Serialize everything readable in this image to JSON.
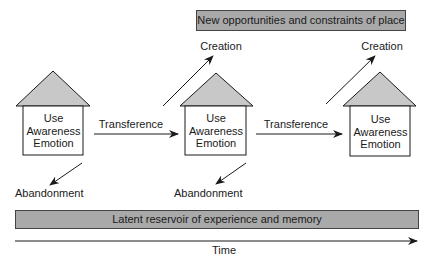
{
  "diagram": {
    "top_banner": "New opportunities and constraints of place",
    "bottom_banner": "Latent reservoir of experience and memory",
    "time_label": "Time",
    "houses": [
      {
        "lines": [
          "Use",
          "Awareness",
          "Emotion"
        ],
        "abandonment": "Abandonment",
        "creation": null
      },
      {
        "lines": [
          "Use",
          "Awareness",
          "Emotion"
        ],
        "abandonment": "Abandonment",
        "creation": "Creation"
      },
      {
        "lines": [
          "Use",
          "Awareness",
          "Emotion"
        ],
        "abandonment": null,
        "creation": "Creation"
      }
    ],
    "transitions": [
      {
        "label": "Transference"
      },
      {
        "label": "Transference"
      }
    ],
    "colors": {
      "banner_fill": "#a9a9a9",
      "roof_fill": "#c8c8c8",
      "stroke": "#1a1a1a"
    }
  }
}
